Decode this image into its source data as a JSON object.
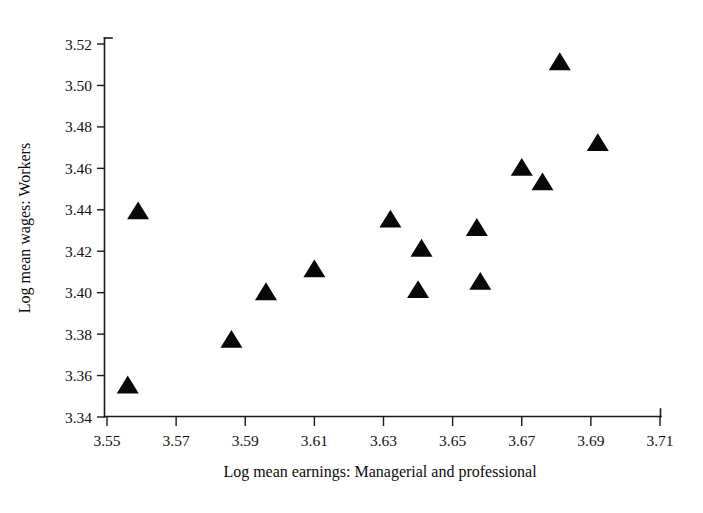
{
  "chart_data": {
    "type": "scatter",
    "title": "",
    "xlabel": "Log mean earnings: Managerial and professional",
    "ylabel": "Log mean wages: Workers",
    "xlim": [
      3.55,
      3.71
    ],
    "ylim": [
      3.34,
      3.52
    ],
    "xticks": [
      "3.55",
      "3.57",
      "3.59",
      "3.61",
      "3.63",
      "3.65",
      "3.67",
      "3.69",
      "3.71"
    ],
    "yticks": [
      "3.34",
      "3.36",
      "3.38",
      "3.40",
      "3.42",
      "3.44",
      "3.46",
      "3.48",
      "3.50",
      "3.52"
    ],
    "xtick_values": [
      3.55,
      3.57,
      3.59,
      3.61,
      3.63,
      3.65,
      3.67,
      3.69,
      3.71
    ],
    "ytick_values": [
      3.34,
      3.36,
      3.38,
      3.4,
      3.42,
      3.44,
      3.46,
      3.48,
      3.5,
      3.52
    ],
    "grid": false,
    "legend": null,
    "marker": "triangle-up",
    "marker_color": "#080808",
    "marker_size": 11,
    "points": [
      {
        "x": 3.556,
        "y": 3.355
      },
      {
        "x": 3.559,
        "y": 3.439
      },
      {
        "x": 3.586,
        "y": 3.377
      },
      {
        "x": 3.596,
        "y": 3.4
      },
      {
        "x": 3.61,
        "y": 3.411
      },
      {
        "x": 3.632,
        "y": 3.435
      },
      {
        "x": 3.64,
        "y": 3.401
      },
      {
        "x": 3.641,
        "y": 3.421
      },
      {
        "x": 3.657,
        "y": 3.431
      },
      {
        "x": 3.658,
        "y": 3.405
      },
      {
        "x": 3.67,
        "y": 3.46
      },
      {
        "x": 3.676,
        "y": 3.453
      },
      {
        "x": 3.681,
        "y": 3.511
      },
      {
        "x": 3.692,
        "y": 3.472
      }
    ]
  },
  "axes": {
    "x_title": "Log mean earnings: Managerial and professional",
    "y_title": "Log mean wages: Workers"
  }
}
